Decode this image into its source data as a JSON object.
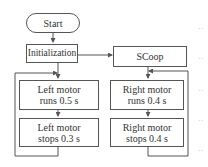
{
  "flowchart": {
    "start": "Start",
    "init": "Initialization",
    "left_task": {
      "step1": "Left motor runs 0.5 s",
      "step2": "Left motor stops 0.3 s"
    },
    "right_task": {
      "header": "SCoop",
      "step1": "Right motor runs 0.4 s",
      "step2": "Right motor stops 0.4 s"
    }
  },
  "colors": {
    "line": "#555555",
    "dots": "#bbbbbb"
  },
  "edge_dots": [
    "··",
    "··",
    "··",
    "··",
    "··"
  ]
}
